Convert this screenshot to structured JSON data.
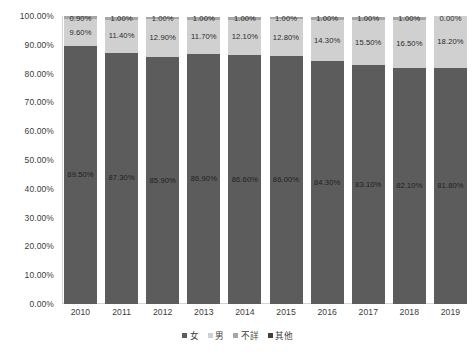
{
  "chart_data": {
    "type": "bar",
    "subtype": "100% stacked column",
    "title": "",
    "xlabel": "",
    "ylabel": "",
    "categories": [
      "2010",
      "2011",
      "2012",
      "2013",
      "2014",
      "2015",
      "2016",
      "2017",
      "2018",
      "2019"
    ],
    "series": [
      {
        "name": "女",
        "color": "#5c5c5c",
        "values": [
          89.5,
          87.3,
          85.9,
          86.9,
          86.6,
          86.0,
          84.3,
          83.1,
          82.1,
          81.8
        ],
        "labels": [
          "89.50%",
          "87.30%",
          "85.90%",
          "86.90%",
          "86.60%",
          "86.00%",
          "84.30%",
          "83.10%",
          "82.10%",
          "81.80%"
        ]
      },
      {
        "name": "男",
        "color": "#d0d0d0",
        "values": [
          9.6,
          11.4,
          12.9,
          11.7,
          12.1,
          12.8,
          14.3,
          15.5,
          16.5,
          18.2
        ],
        "labels": [
          "9.60%",
          "11.40%",
          "12.90%",
          "11.70%",
          "12.10%",
          "12.80%",
          "14.30%",
          "15.50%",
          "16.50%",
          "18.20%"
        ]
      },
      {
        "name": "不詳",
        "color": "#a6a6a6",
        "values": [
          0.9,
          1.0,
          1.0,
          1.0,
          1.0,
          1.0,
          1.0,
          1.0,
          1.0,
          0.0
        ],
        "labels": [
          "0.90%",
          "1.00%",
          "1.00%",
          "1.00%",
          "1.00%",
          "1.00%",
          "1.00%",
          "1.00%",
          "1.00%",
          "0.00%"
        ]
      },
      {
        "name": "其他",
        "color": "#404040",
        "values": [
          0.0,
          0.0,
          0.0,
          0.0,
          0.0,
          0.0,
          0.0,
          0.0,
          0.0,
          0.0
        ],
        "labels": [
          "",
          "",
          "",
          "",
          "",
          "",
          "",
          "",
          "",
          ""
        ]
      }
    ],
    "ylim": [
      0,
      100
    ],
    "yticks": [
      100,
      90,
      80,
      70,
      60,
      50,
      40,
      30,
      20,
      10,
      0
    ],
    "ytick_labels": [
      "100.00%",
      "90.00%",
      "80.00%",
      "70.00%",
      "60.00%",
      "50.00%",
      "40.00%",
      "30.00%",
      "20.00%",
      "10.00%",
      "0.00%"
    ],
    "grid": false,
    "legend_position": "bottom"
  },
  "legend": {
    "items": [
      {
        "label": "女",
        "color": "#5c5c5c"
      },
      {
        "label": "男",
        "color": "#d0d0d0"
      },
      {
        "label": "不詳",
        "color": "#a6a6a6"
      },
      {
        "label": "其他",
        "color": "#404040"
      }
    ]
  }
}
